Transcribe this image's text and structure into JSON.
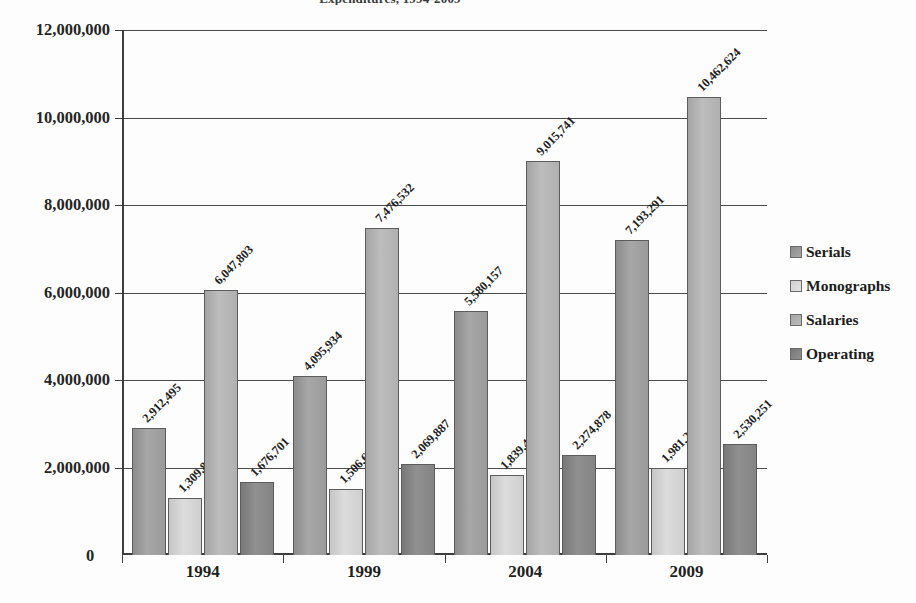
{
  "chart_data": {
    "type": "bar",
    "title": "Expenditures, 1994-2009",
    "xlabel": "",
    "ylabel": "",
    "categories": [
      "1994",
      "1999",
      "2004",
      "2009"
    ],
    "series": [
      {
        "name": "Serials",
        "values": [
          2912495,
          4095934,
          5580157,
          7193291
        ],
        "labels": [
          "2,912,495",
          "4,095,934",
          "5,580,157",
          "7,193,291"
        ]
      },
      {
        "name": "Monographs",
        "values": [
          1309807,
          1506651,
          1839412,
          1981284
        ],
        "labels": [
          "1,309,807",
          "1,506,651",
          "1,839,412",
          "1,981,284"
        ]
      },
      {
        "name": "Salaries",
        "values": [
          6047803,
          7476532,
          9015741,
          10462624
        ],
        "labels": [
          "6,047,803",
          "7,476,532",
          "9,015,741",
          "10,462,624"
        ]
      },
      {
        "name": "Operating",
        "values": [
          1676701,
          2069887,
          2274878,
          2530251
        ],
        "labels": [
          "1,676,701",
          "2,069,887",
          "2,274,878",
          "2,530,251"
        ]
      }
    ],
    "ylim": [
      0,
      12000000
    ],
    "yticks": [
      0,
      2000000,
      4000000,
      6000000,
      8000000,
      10000000,
      12000000
    ],
    "ytick_labels": [
      "0",
      "2,000,000",
      "4,000,000",
      "6,000,000",
      "8,000,000",
      "10,000,000",
      "12,000,000"
    ],
    "grid": true,
    "legend_position": "right"
  },
  "axis": {
    "zero_label": "0",
    "y_labels": [
      "12,000,000",
      "10,000,000",
      "8,000,000",
      "6,000,000",
      "4,000,000",
      "2,000,000"
    ],
    "x_labels": [
      "1994",
      "1999",
      "2004",
      "2009"
    ]
  },
  "legend": {
    "items": [
      {
        "label": "Serials"
      },
      {
        "label": "Monographs"
      },
      {
        "label": "Salaries"
      },
      {
        "label": "Operating"
      }
    ]
  }
}
